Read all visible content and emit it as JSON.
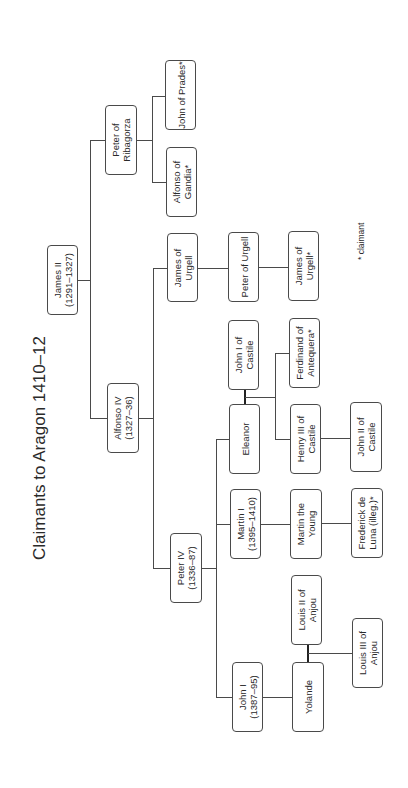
{
  "title": "Claimants to Aragon 1410–12",
  "legend": "* claimant",
  "nodes": {
    "james_ii": {
      "name": "James II",
      "dates": "(1291–1327)"
    },
    "alfonso_iv": {
      "name": "Alfonso IV",
      "dates": "(1327–36)"
    },
    "peter_iv": {
      "name": "Peter IV",
      "dates": "(1336–87)"
    },
    "peter_ribagorza": {
      "name": "Peter of",
      "name2": "Ribagorza"
    },
    "alfonso_gandia": {
      "name": "Alfonso of",
      "name2": "Gandia*"
    },
    "john_prades": {
      "name": "John of Prades*"
    },
    "james_urgell_1": {
      "name": "James of",
      "name2": "Urgell"
    },
    "peter_urgell": {
      "name": "Peter of Urgell"
    },
    "james_urgell_2": {
      "name": "James of",
      "name2": "Urgell*"
    },
    "john_i_castile": {
      "name": "John I of",
      "name2": "Castile"
    },
    "ferdinand": {
      "name": "Ferdinand of",
      "name2": "Antequera*"
    },
    "eleanor": {
      "name": "Eleanor"
    },
    "henry_iii": {
      "name": "Henry III of",
      "name2": "Castile"
    },
    "john_ii_castile": {
      "name": "John II of",
      "name2": "Castile"
    },
    "martin_i": {
      "name": "Martin I",
      "dates": "(1395–1410)"
    },
    "martin_young": {
      "name": "Martin the",
      "name2": "Young"
    },
    "frederick": {
      "name": "Frederick de",
      "name2": "Luna (illeg.)*"
    },
    "louis_ii": {
      "name": "Louis II of",
      "name2": "Anjou"
    },
    "louis_iii": {
      "name": "Louis III of",
      "name2": "Anjou"
    },
    "john_i": {
      "name": "John I",
      "dates": "(1387–95)"
    },
    "yolande": {
      "name": "Yolande"
    }
  }
}
